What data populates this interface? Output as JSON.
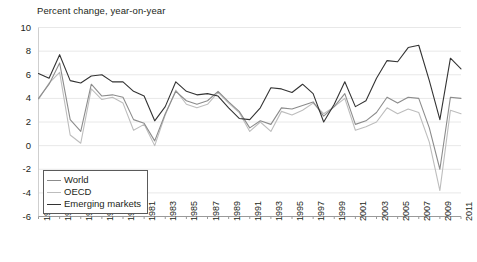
{
  "chart_data": {
    "type": "line",
    "title": "Percent change, year-on-year",
    "xlabel": "",
    "ylabel": "",
    "ylim": [
      -6,
      10
    ],
    "ytick_values": [
      10,
      8,
      6,
      4,
      2,
      0,
      -2,
      -4,
      -6
    ],
    "ytick_labels": [
      "10",
      "8",
      "6",
      "4",
      "2",
      "0",
      "-2",
      "-4",
      "-6"
    ],
    "grid": true,
    "grid_axis": "y",
    "legend_position": "lower-left",
    "x": [
      1971,
      1972,
      1973,
      1974,
      1975,
      1976,
      1977,
      1978,
      1979,
      1980,
      1981,
      1982,
      1983,
      1984,
      1985,
      1986,
      1987,
      1988,
      1989,
      1990,
      1991,
      1992,
      1993,
      1994,
      1995,
      1996,
      1997,
      1998,
      1999,
      2000,
      2001,
      2002,
      2003,
      2004,
      2005,
      2006,
      2007,
      2008,
      2009,
      2010,
      2011
    ],
    "xtick_labels": [
      "1971",
      "1973",
      "1975",
      "1977",
      "1979",
      "1981",
      "1983",
      "1985",
      "1987",
      "1989",
      "1991",
      "1993",
      "1995",
      "1997",
      "1999",
      "2001",
      "2003",
      "2005",
      "2007",
      "2009",
      "2011"
    ],
    "series": [
      {
        "name": "World",
        "color": "#8c8c8c",
        "values": [
          4.0,
          5.2,
          7.0,
          2.2,
          1.2,
          5.2,
          4.2,
          4.3,
          4.1,
          2.2,
          1.9,
          0.4,
          2.7,
          4.6,
          3.8,
          3.5,
          3.8,
          4.6,
          3.7,
          2.9,
          1.5,
          2.1,
          1.8,
          3.2,
          3.1,
          3.4,
          3.7,
          2.5,
          3.3,
          4.4,
          1.8,
          2.1,
          2.8,
          4.1,
          3.6,
          4.1,
          4.0,
          1.5,
          -2.0,
          4.1,
          4.0
        ]
      },
      {
        "name": "OECD",
        "color": "#bdbdbd",
        "values": [
          3.9,
          5.3,
          6.2,
          0.9,
          0.2,
          4.8,
          3.9,
          4.1,
          3.6,
          1.3,
          1.8,
          0.0,
          2.6,
          4.7,
          3.5,
          3.2,
          3.5,
          4.5,
          3.6,
          2.8,
          1.2,
          2.0,
          1.2,
          2.9,
          2.6,
          3.0,
          3.6,
          2.7,
          3.3,
          4.0,
          1.3,
          1.6,
          2.0,
          3.2,
          2.7,
          3.1,
          2.8,
          0.3,
          -3.8,
          3.0,
          2.7
        ]
      },
      {
        "name": "Emerging markets",
        "color": "#333333",
        "values": [
          6.1,
          5.7,
          7.7,
          5.5,
          5.3,
          5.9,
          6.0,
          5.4,
          5.4,
          4.6,
          4.2,
          2.1,
          3.3,
          5.4,
          4.6,
          4.3,
          4.4,
          4.2,
          3.2,
          2.3,
          2.2,
          3.2,
          4.9,
          4.8,
          4.5,
          5.2,
          4.4,
          2.0,
          3.5,
          5.4,
          3.3,
          3.8,
          5.7,
          7.2,
          7.1,
          8.3,
          8.5,
          5.5,
          2.2,
          7.4,
          6.5
        ]
      }
    ]
  },
  "legend": {
    "items": [
      {
        "label": "World"
      },
      {
        "label": "OECD"
      },
      {
        "label": "Emerging markets"
      }
    ]
  }
}
